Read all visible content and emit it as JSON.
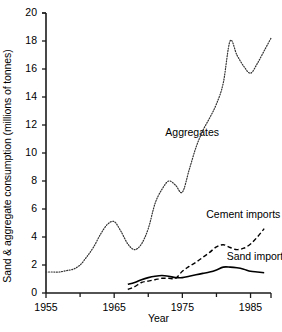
{
  "chart_data": {
    "type": "line",
    "title": "",
    "xlabel": "Year",
    "ylabel": "Sand & aggregate consumption (millions of tonnes)",
    "xlim": [
      1955,
      1988
    ],
    "ylim": [
      0,
      20
    ],
    "x_major_ticks": [
      1955,
      1965,
      1975,
      1985
    ],
    "x_minor_ticks": [
      1960,
      1970,
      1980
    ],
    "x_tick_labels": [
      "1955",
      "1965",
      "1975",
      "1985"
    ],
    "y_ticks": [
      0,
      2,
      4,
      6,
      8,
      10,
      12,
      14,
      16,
      18,
      20
    ],
    "y_tick_labels": [
      "0",
      "2",
      "4",
      "6",
      "8",
      "10",
      "12",
      "14",
      "16",
      "18",
      "20"
    ],
    "grid": false,
    "legend_position": "inline-annotations",
    "series": [
      {
        "name": "Aggregates",
        "style": "dotted",
        "color": "#333333",
        "label_x": 1972.5,
        "label_y": 11.4,
        "x": [
          1955,
          1956,
          1957,
          1958,
          1959,
          1960,
          1961,
          1962,
          1963,
          1964,
          1965,
          1966,
          1967,
          1968,
          1969,
          1970,
          1971,
          1972,
          1973,
          1974,
          1975,
          1976,
          1977,
          1978,
          1979,
          1980,
          1981,
          1982,
          1983,
          1984,
          1985,
          1986,
          1987,
          1988
        ],
        "y": [
          1.5,
          1.5,
          1.5,
          1.6,
          1.7,
          2.0,
          2.6,
          3.3,
          4.2,
          4.9,
          5.1,
          4.4,
          3.5,
          3.1,
          3.5,
          4.6,
          6.4,
          7.4,
          8.0,
          7.7,
          7.2,
          8.8,
          10.4,
          11.6,
          12.5,
          13.5,
          15.0,
          18.0,
          17.0,
          16.2,
          15.7,
          16.4,
          17.3,
          18.2
        ]
      },
      {
        "name": "Cement imports",
        "style": "dashed",
        "color": "#000000",
        "label_x": 1978.5,
        "label_y": 5.6,
        "x": [
          1967,
          1968,
          1969,
          1970,
          1971,
          1972,
          1973,
          1974,
          1975,
          1976,
          1977,
          1978,
          1979,
          1980,
          1981,
          1982,
          1983,
          1984,
          1985,
          1986,
          1987
        ],
        "y": [
          0.25,
          0.45,
          0.75,
          0.85,
          0.95,
          1.05,
          1.05,
          1.05,
          1.55,
          1.9,
          2.2,
          2.55,
          2.9,
          3.3,
          3.45,
          3.25,
          3.1,
          3.2,
          3.5,
          4.0,
          4.6
        ]
      },
      {
        "name": "Sand imports",
        "style": "solid",
        "color": "#000000",
        "label_x": 1981.5,
        "label_y": 2.55,
        "x": [
          1967,
          1968,
          1969,
          1970,
          1971,
          1972,
          1973,
          1974,
          1975,
          1976,
          1977,
          1978,
          1979,
          1980,
          1981,
          1982,
          1983,
          1984,
          1985,
          1986,
          1987
        ],
        "y": [
          0.62,
          0.75,
          0.95,
          1.1,
          1.2,
          1.25,
          1.2,
          1.1,
          1.1,
          1.2,
          1.3,
          1.4,
          1.5,
          1.65,
          1.85,
          1.85,
          1.8,
          1.7,
          1.55,
          1.5,
          1.45
        ]
      }
    ]
  }
}
